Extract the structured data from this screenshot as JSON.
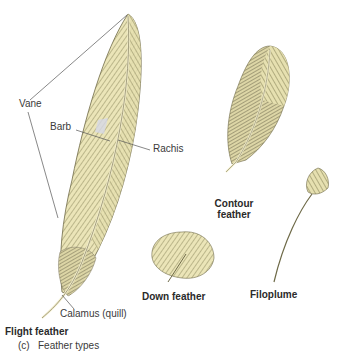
{
  "figure": {
    "caption_letter": "(c)",
    "caption_text": "Feather types"
  },
  "labels": {
    "vane": "Vane",
    "barb": "Barb",
    "rachis": "Rachis",
    "calamus": "Calamus (quill)",
    "flight_feather": "Flight feather",
    "contour_feather_line1": "Contour",
    "contour_feather_line2": "feather",
    "down_feather": "Down feather",
    "filoplume": "Filoplume"
  },
  "colors": {
    "feather_fill": "#e8e2b4",
    "feather_stroke": "#6e6a48",
    "barb_dark": "#8a855a",
    "leader_line": "#555555",
    "background": "#ffffff"
  }
}
